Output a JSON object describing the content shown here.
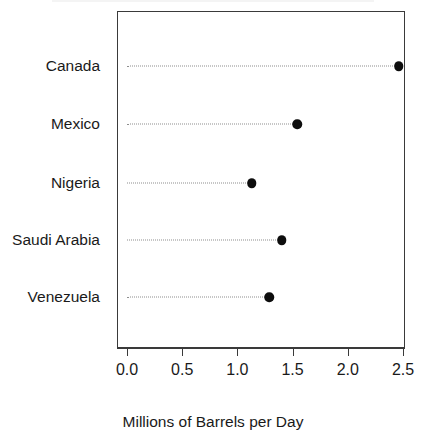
{
  "chart_data": {
    "type": "scatter",
    "subtype": "cleveland-dot-plot",
    "title": "",
    "xlabel": "Millions of Barrels per Day",
    "ylabel": "",
    "categories": [
      "Canada",
      "Mexico",
      "Nigeria",
      "Saudi Arabia",
      "Venezuela"
    ],
    "values": [
      2.46,
      1.54,
      1.13,
      1.4,
      1.29
    ],
    "points": [
      {
        "category": "Canada",
        "value": 2.46
      },
      {
        "category": "Mexico",
        "value": 1.54
      },
      {
        "category": "Nigeria",
        "value": 1.13
      },
      {
        "category": "Saudi Arabia",
        "value": 1.4
      },
      {
        "category": "Venezuela",
        "value": 1.29
      }
    ],
    "xlim": [
      0.0,
      2.5
    ],
    "xticks": [
      0.0,
      0.5,
      1.0,
      1.5,
      2.0,
      2.5
    ],
    "xtick_labels": [
      "0.0",
      "0.5",
      "1.0",
      "1.5",
      "2.0",
      "2.5"
    ],
    "grid": false,
    "legend": null,
    "leader_lines": "dotted",
    "marker": "filled-circle",
    "marker_color": "#0d0d0d",
    "frame_color": "#3a3a3a",
    "leader_color": "#8d8d8d",
    "background": "#ffffff"
  },
  "geometry": {
    "plot_left_px": 117,
    "plot_right_px": 405,
    "plot_top_px": 11,
    "plot_bottom_px": 348,
    "x0_px": 127,
    "x_per_unit_px": 110.4,
    "row_y_px": [
      66,
      124,
      183,
      240,
      297
    ]
  }
}
